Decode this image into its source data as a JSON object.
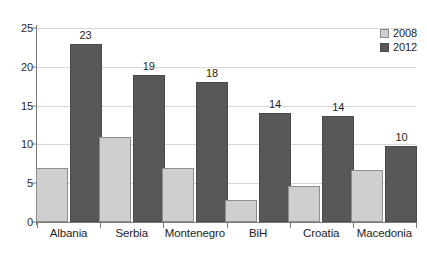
{
  "chart_data": {
    "type": "bar",
    "title": "",
    "xlabel": "",
    "ylabel": "",
    "categories": [
      "Albania",
      "Serbia",
      "Montenegro",
      "BiH",
      "Croatia",
      "Macedonia"
    ],
    "series": [
      {
        "name": "2008",
        "color": "#cfcfcf",
        "values": [
          7.0,
          11.0,
          6.9,
          2.8,
          4.7,
          6.7
        ],
        "labels": [
          "",
          "",
          "",
          "",
          "",
          ""
        ]
      },
      {
        "name": "2012",
        "color": "#585858",
        "values": [
          23.0,
          19.0,
          18.0,
          14.0,
          13.6,
          9.8
        ],
        "labels": [
          "23",
          "19",
          "18",
          "14",
          "14",
          "10"
        ]
      }
    ],
    "ylim": [
      0,
      25
    ],
    "yticks": [
      0,
      5,
      10,
      15,
      20,
      25
    ],
    "ytick_labels": [
      "0",
      "5",
      "10",
      "15",
      "20",
      "25"
    ],
    "grid": true,
    "grid_axis": "y",
    "legend_position": "top-right",
    "legend_entries": [
      "2008",
      "2012"
    ]
  },
  "legend": {
    "entries": [
      {
        "label": "2008",
        "color": "#cfcfcf"
      },
      {
        "label": "2012",
        "color": "#585858"
      }
    ]
  },
  "axes": {
    "y_ticks": [
      "0",
      "5",
      "10",
      "15",
      "20",
      "25"
    ],
    "x_categories": [
      "Albania",
      "Serbia",
      "Montenegro",
      "BiH",
      "Croatia",
      "Macedonia"
    ]
  }
}
